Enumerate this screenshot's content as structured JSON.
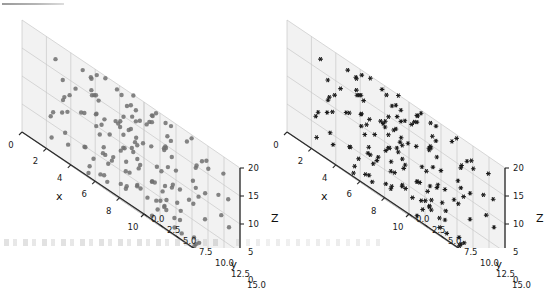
{
  "figure": {
    "background_color": "#ffffff",
    "pane_color": "#f2f2f2",
    "grid_color": "#c8c8c8",
    "spine_color": "#2b2b2b",
    "width": 530,
    "height": 248
  },
  "chart_data": [
    {
      "type": "scatter",
      "projection": "3d",
      "title": "",
      "xlabel": "x",
      "ylabel": "y",
      "zlabel": "Z",
      "xlim": [
        0,
        10
      ],
      "ylim": [
        0,
        15
      ],
      "zlim": [
        0,
        20
      ],
      "xticks": [
        "0",
        "2",
        "4",
        "6",
        "8",
        "10"
      ],
      "yticks": [
        "0.0",
        "2.5",
        "5.0",
        "7.5",
        "10.0",
        "12.5",
        "15.0"
      ],
      "zticks": [
        "0",
        "5",
        "10",
        "15",
        "20"
      ],
      "grid": true,
      "legend": "none",
      "marker": "circle",
      "marker_size": 4.4,
      "marker_color": "#707070",
      "n_points": 150,
      "elev": 22,
      "azim": -60,
      "points": [
        [
          0.42,
          12.9,
          10.3
        ],
        [
          0.95,
          11.2,
          6.1
        ],
        [
          1.35,
          14.1,
          13.4
        ],
        [
          1.8,
          9.4,
          2.3
        ],
        [
          2.2,
          13.6,
          17.8
        ],
        [
          2.65,
          7.1,
          9.0
        ],
        [
          3.05,
          12.2,
          4.6
        ],
        [
          3.5,
          5.3,
          14.9
        ],
        [
          3.9,
          10.8,
          7.7
        ],
        [
          4.3,
          14.6,
          11.5
        ],
        [
          4.75,
          3.2,
          1.9
        ],
        [
          5.15,
          8.6,
          16.3
        ],
        [
          5.6,
          11.9,
          5.4
        ],
        [
          6.0,
          6.4,
          12.8
        ],
        [
          6.45,
          13.8,
          8.2
        ],
        [
          6.85,
          2.5,
          18.6
        ],
        [
          7.3,
          9.9,
          3.1
        ],
        [
          7.7,
          12.6,
          15.2
        ],
        [
          8.15,
          4.8,
          6.9
        ],
        [
          8.55,
          10.2,
          19.4
        ],
        [
          9.0,
          7.8,
          1.2
        ],
        [
          9.4,
          14.3,
          13.0
        ],
        [
          9.85,
          5.9,
          8.8
        ],
        [
          0.7,
          3.9,
          17.1
        ],
        [
          1.15,
          8.2,
          0.8
        ],
        [
          1.6,
          12.8,
          11.9
        ],
        [
          2.05,
          6.0,
          5.0
        ],
        [
          2.45,
          1.7,
          14.2
        ],
        [
          2.9,
          10.5,
          9.6
        ],
        [
          3.3,
          14.9,
          2.7
        ],
        [
          3.75,
          4.4,
          12.1
        ],
        [
          4.15,
          9.1,
          18.0
        ],
        [
          4.6,
          13.2,
          6.5
        ],
        [
          5.0,
          2.9,
          10.9
        ],
        [
          5.4,
          7.5,
          15.7
        ],
        [
          5.85,
          11.4,
          3.6
        ],
        [
          6.25,
          5.1,
          13.7
        ],
        [
          6.7,
          14.0,
          8.0
        ],
        [
          7.1,
          8.9,
          19.0
        ],
        [
          7.55,
          3.6,
          4.2
        ],
        [
          7.95,
          12.0,
          11.1
        ],
        [
          8.4,
          6.7,
          16.8
        ],
        [
          8.8,
          10.1,
          2.0
        ],
        [
          9.25,
          13.5,
          9.3
        ],
        [
          9.65,
          4.1,
          14.5
        ],
        [
          0.25,
          10.7,
          4.0
        ],
        [
          0.65,
          6.2,
          12.4
        ],
        [
          1.05,
          14.4,
          17.5
        ],
        [
          1.45,
          2.1,
          7.3
        ],
        [
          1.9,
          9.7,
          1.5
        ],
        [
          2.3,
          13.0,
          10.0
        ],
        [
          2.75,
          5.6,
          15.9
        ],
        [
          3.15,
          1.2,
          3.3
        ],
        [
          3.6,
          11.6,
          8.5
        ],
        [
          4.0,
          7.0,
          13.3
        ],
        [
          4.45,
          14.8,
          19.2
        ],
        [
          4.85,
          3.4,
          6.0
        ],
        [
          5.25,
          8.0,
          11.6
        ],
        [
          5.7,
          12.4,
          16.5
        ],
        [
          6.1,
          4.6,
          2.4
        ],
        [
          6.55,
          9.3,
          9.9
        ],
        [
          6.95,
          13.9,
          14.7
        ],
        [
          7.4,
          2.7,
          5.7
        ],
        [
          7.8,
          10.9,
          18.3
        ],
        [
          8.25,
          6.5,
          3.8
        ],
        [
          8.65,
          14.2,
          12.6
        ],
        [
          9.1,
          5.0,
          7.6
        ],
        [
          9.5,
          11.0,
          16.0
        ],
        [
          9.9,
          8.3,
          1.0
        ],
        [
          0.5,
          13.3,
          6.7
        ],
        [
          0.9,
          4.9,
          11.4
        ],
        [
          1.3,
          8.8,
          15.4
        ],
        [
          1.75,
          12.1,
          2.8
        ],
        [
          2.15,
          3.0,
          9.1
        ],
        [
          2.6,
          10.4,
          13.9
        ],
        [
          3.0,
          14.7,
          18.8
        ],
        [
          3.45,
          6.9,
          4.8
        ],
        [
          3.85,
          1.9,
          10.6
        ],
        [
          4.25,
          11.8,
          17.3
        ],
        [
          4.7,
          7.4,
          3.0
        ],
        [
          5.1,
          13.7,
          8.3
        ],
        [
          5.5,
          2.4,
          12.2
        ],
        [
          5.95,
          9.6,
          19.6
        ],
        [
          6.35,
          12.7,
          5.2
        ],
        [
          6.8,
          4.2,
          10.4
        ],
        [
          7.2,
          8.5,
          14.0
        ],
        [
          7.65,
          13.1,
          1.7
        ],
        [
          8.05,
          5.4,
          7.0
        ],
        [
          8.45,
          10.6,
          12.0
        ],
        [
          8.9,
          14.5,
          17.0
        ],
        [
          9.35,
          3.8,
          4.4
        ],
        [
          9.75,
          9.0,
          9.8
        ],
        [
          0.35,
          7.7,
          14.3
        ],
        [
          0.8,
          11.5,
          19.8
        ],
        [
          1.2,
          2.2,
          6.3
        ],
        [
          1.65,
          6.6,
          11.0
        ],
        [
          2.0,
          13.4,
          16.2
        ],
        [
          2.5,
          5.8,
          2.1
        ],
        [
          2.85,
          10.0,
          8.7
        ],
        [
          3.25,
          14.0,
          13.2
        ],
        [
          3.7,
          3.7,
          18.1
        ],
        [
          4.1,
          8.4,
          5.6
        ],
        [
          4.5,
          12.5,
          10.2
        ],
        [
          4.95,
          1.5,
          15.0
        ],
        [
          5.35,
          7.2,
          20.0
        ],
        [
          5.75,
          11.3,
          4.1
        ],
        [
          6.2,
          4.0,
          9.4
        ],
        [
          6.6,
          9.8,
          14.8
        ],
        [
          7.0,
          13.6,
          0.6
        ],
        [
          7.45,
          6.1,
          6.8
        ],
        [
          7.9,
          2.6,
          11.8
        ],
        [
          8.3,
          12.3,
          16.6
        ],
        [
          8.7,
          8.1,
          3.4
        ],
        [
          9.15,
          14.9,
          8.1
        ],
        [
          9.55,
          5.2,
          13.6
        ],
        [
          0.15,
          9.2,
          18.5
        ],
        [
          0.6,
          12.9,
          5.9
        ],
        [
          1.0,
          4.5,
          10.7
        ],
        [
          1.5,
          8.7,
          15.6
        ],
        [
          1.85,
          1.1,
          2.6
        ],
        [
          2.4,
          11.7,
          7.4
        ],
        [
          2.8,
          6.3,
          12.3
        ],
        [
          3.2,
          14.2,
          17.6
        ],
        [
          3.65,
          2.8,
          4.9
        ],
        [
          4.05,
          10.3,
          9.2
        ],
        [
          4.4,
          13.8,
          14.4
        ],
        [
          4.9,
          5.5,
          19.1
        ],
        [
          5.3,
          9.5,
          3.5
        ],
        [
          5.65,
          12.8,
          8.9
        ],
        [
          6.15,
          3.3,
          13.1
        ],
        [
          6.5,
          7.9,
          18.7
        ],
        [
          6.9,
          11.1,
          6.2
        ],
        [
          7.35,
          14.6,
          11.3
        ],
        [
          7.75,
          4.7,
          16.4
        ],
        [
          8.2,
          8.2,
          1.4
        ],
        [
          8.6,
          12.2,
          6.6
        ],
        [
          9.05,
          6.8,
          11.7
        ],
        [
          9.45,
          10.8,
          17.2
        ],
        [
          9.8,
          2.3,
          3.9
        ],
        [
          0.3,
          5.7,
          8.4
        ],
        [
          0.75,
          13.9,
          12.9
        ],
        [
          1.25,
          9.3,
          19.3
        ],
        [
          1.7,
          3.5,
          5.1
        ],
        [
          2.1,
          7.6,
          10.1
        ],
        [
          2.55,
          11.0,
          15.1
        ],
        [
          3.1,
          14.4,
          0.9
        ],
        [
          3.55,
          6.0,
          7.2
        ],
        [
          4.2,
          10.9,
          12.7
        ],
        [
          4.65,
          2.0,
          17.9
        ],
        [
          5.05,
          8.9,
          4.3
        ]
      ]
    },
    {
      "type": "scatter",
      "projection": "3d",
      "title": "",
      "xlabel": "x",
      "ylabel": "y",
      "zlabel": "Z",
      "xlim": [
        0,
        10
      ],
      "ylim": [
        0,
        15
      ],
      "zlim": [
        0,
        20
      ],
      "xticks": [
        "0",
        "2",
        "4",
        "6",
        "8",
        "10"
      ],
      "yticks": [
        "0.0",
        "2.5",
        "5.0",
        "7.5",
        "10.0",
        "12.5",
        "15.0"
      ],
      "zticks": [
        "0",
        "5",
        "10",
        "15",
        "20"
      ],
      "grid": true,
      "legend": "none",
      "marker": "star",
      "marker_size": 3.0,
      "marker_color": "#1c1c1c",
      "n_points": 150,
      "elev": 22,
      "azim": -60,
      "same_points_as_panel": 0
    }
  ]
}
